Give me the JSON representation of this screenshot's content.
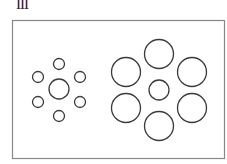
{
  "figure": {
    "label": "III",
    "frame": {
      "x": 12.5,
      "y": 20.5,
      "width": 212,
      "height": 138,
      "stroke": "#888888"
    },
    "stroke_color": "#3a3a3a",
    "left_group": {
      "center": {
        "cx": 59,
        "cy": 89,
        "r": 10
      },
      "surround_r": 5.5,
      "surround": [
        {
          "cx": 59,
          "cy": 64
        },
        {
          "cx": 38,
          "cy": 77
        },
        {
          "cx": 80,
          "cy": 77
        },
        {
          "cx": 38,
          "cy": 102
        },
        {
          "cx": 80,
          "cy": 102
        },
        {
          "cx": 59,
          "cy": 116
        }
      ]
    },
    "right_group": {
      "center": {
        "cx": 159,
        "cy": 90,
        "r": 10
      },
      "surround_r": 14.5,
      "surround": [
        {
          "cx": 159,
          "cy": 54
        },
        {
          "cx": 126,
          "cy": 72
        },
        {
          "cx": 192,
          "cy": 72
        },
        {
          "cx": 126,
          "cy": 108
        },
        {
          "cx": 192,
          "cy": 108
        },
        {
          "cx": 159,
          "cy": 126
        }
      ]
    }
  }
}
